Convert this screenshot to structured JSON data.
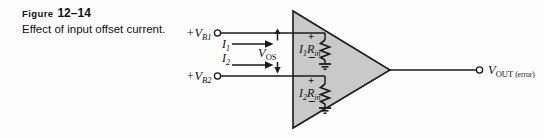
{
  "figure": {
    "label_word": "Figure",
    "label_number": "12–14",
    "caption": "Effect of input offset current."
  },
  "diagram": {
    "type": "op-amp-input-offset-current-schematic",
    "amplifier": {
      "shape": "triangle",
      "fill_color": "#c9c9c9",
      "stroke_color": "#1a1a1a"
    },
    "inputs": [
      {
        "source_label": "+V",
        "source_subscript": "B1",
        "current_label": "I",
        "current_subscript": "1",
        "drop_label": "I",
        "drop_subscript": "1",
        "drop_label2": "R",
        "drop_subscript2": "in",
        "polarity_top": "+",
        "polarity_bottom": "−"
      },
      {
        "source_label": "+V",
        "source_subscript": "B2",
        "current_label": "I",
        "current_subscript": "2",
        "drop_label": "I",
        "drop_subscript": "2",
        "drop_label2": "R",
        "drop_subscript2": "in",
        "polarity_top": "+",
        "polarity_bottom": "−"
      }
    ],
    "offset_voltage": {
      "label": "V",
      "subscript": "OS"
    },
    "output": {
      "label": "V",
      "subscript": "OUT",
      "qualifier": "(error)"
    }
  },
  "colors": {
    "ink": "#111111",
    "amp_fill": "#c9c9c9",
    "page_bg": "#fdfdfd"
  }
}
